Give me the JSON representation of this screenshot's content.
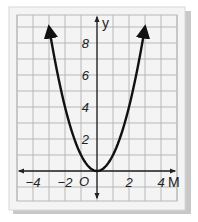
{
  "chart_data": {
    "type": "line",
    "title": "",
    "xlabel": "M",
    "ylabel": "y",
    "origin_label": "O",
    "x_ticks": [
      -4,
      -2,
      2,
      4
    ],
    "x_tick_labels": [
      "−4",
      "−2",
      "2",
      "4"
    ],
    "y_ticks": [
      2,
      4,
      6,
      8
    ],
    "y_tick_labels": [
      "2",
      "4",
      "6",
      "8"
    ],
    "xlim": [
      -5,
      5
    ],
    "ylim": [
      -1.9,
      9.75
    ],
    "grid": true,
    "grid_step": 1,
    "series": [
      {
        "name": "y = x^2",
        "x": [
          -3,
          -2.5,
          -2,
          -1.5,
          -1,
          -0.5,
          0,
          0.5,
          1,
          1.5,
          2,
          2.5,
          3
        ],
        "y": [
          9,
          6.25,
          4,
          2.25,
          1,
          0.25,
          0,
          0.25,
          1,
          2.25,
          4,
          6.25,
          9
        ],
        "arrows_at_ends": true
      }
    ],
    "colors": {
      "background": "#f2f2f2",
      "grid": "#b8b8b8",
      "curve": "#111111",
      "axis": "#222222",
      "shadow": "#c8c8c8"
    }
  }
}
